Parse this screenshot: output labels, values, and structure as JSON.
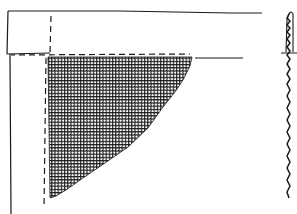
{
  "diagram": {
    "kind": "hand-drawn sketch",
    "colors": {
      "ink": "#1a1a1a",
      "background": "#ffffff"
    },
    "elements": [
      {
        "name": "top-horizontal-box",
        "description": "Long horizontal rectangle across top, open on right"
      },
      {
        "name": "dashed-guide-vertical",
        "description": "Dashed vertical line inside box and down left of hatch"
      },
      {
        "name": "dashed-guide-horizontal",
        "description": "Dashed horizontal line along bottom of box"
      },
      {
        "name": "left-vertical-post",
        "description": "Solid vertical line descending from box at left"
      },
      {
        "name": "hatched-triangle",
        "description": "Cross-hatched inverted triangular region hanging below box"
      },
      {
        "name": "right-capsule",
        "description": "Tall narrow rounded capsule with squiggle pattern and crossbar on right side"
      }
    ]
  }
}
